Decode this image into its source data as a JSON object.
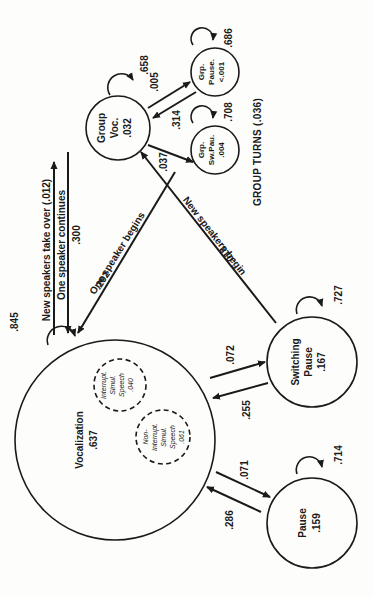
{
  "diagram": {
    "title": "GROUP TURNS (.036)",
    "orientation": "rotated 90 degrees counter-clockwise",
    "nodes": {
      "vocalization": {
        "name": "Vocalization",
        "value": ".637",
        "self_loop": ".845"
      },
      "interrupt": {
        "line1": "Interrupt.",
        "line2": "Simul.",
        "line3": "Speech",
        "value": ".040"
      },
      "non_interrupt": {
        "line1": "Non-",
        "line2": "Interrupt.",
        "line3": "Simul.",
        "line4": "Speech",
        "value": ".061"
      },
      "group_voc": {
        "line1": "Group",
        "line2": "Voc.",
        "value": ".032",
        "self_loop": ".658"
      },
      "grp_pause": {
        "line1": "Grp.",
        "line2": "Pause.",
        "value": "<.001",
        "self_loop": ".686"
      },
      "grp_sw_pau": {
        "line1": "Grp.",
        "line2": "Sw.Pau.",
        "value": ".004",
        "self_loop": ".708"
      },
      "switching_pause": {
        "line1": "Switching",
        "line2": "Pause",
        "value": ".167",
        "self_loop": ".727"
      },
      "pause": {
        "name": "Pause",
        "value": ".159",
        "self_loop": ".714"
      }
    },
    "edges": {
      "voc_to_group": {
        "label": "New speakers take over (.012)"
      },
      "group_to_voc_continues": {
        "label": "One speaker continues",
        "value": ".300"
      },
      "grpsw_to_voc_begins": {
        "label": "One speaker begins",
        "value": ".292"
      },
      "switch_to_group": {
        "label": "New speakers begin",
        "value": ".018"
      },
      "group_to_grppause": {
        "value": ".005"
      },
      "grppause_to_group": {
        "value": ".314"
      },
      "group_to_grpsw": {
        "value": ".037"
      },
      "voc_to_switch": {
        "value": ".072"
      },
      "switch_to_voc": {
        "value": ".255"
      },
      "voc_to_pause": {
        "value": ".071"
      },
      "pause_to_voc": {
        "value": ".286"
      }
    }
  }
}
